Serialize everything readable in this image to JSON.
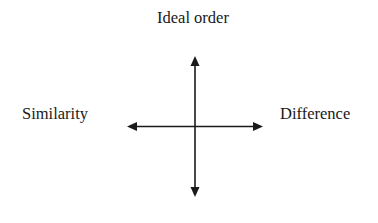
{
  "diagram": {
    "type": "axes-cross",
    "labels": {
      "top": "Ideal order",
      "left": "Similarity",
      "right": "Difference",
      "bottom": ""
    },
    "colors": {
      "line": "#1a1a1a",
      "text": "#1a1a1a",
      "background": "#ffffff"
    }
  }
}
